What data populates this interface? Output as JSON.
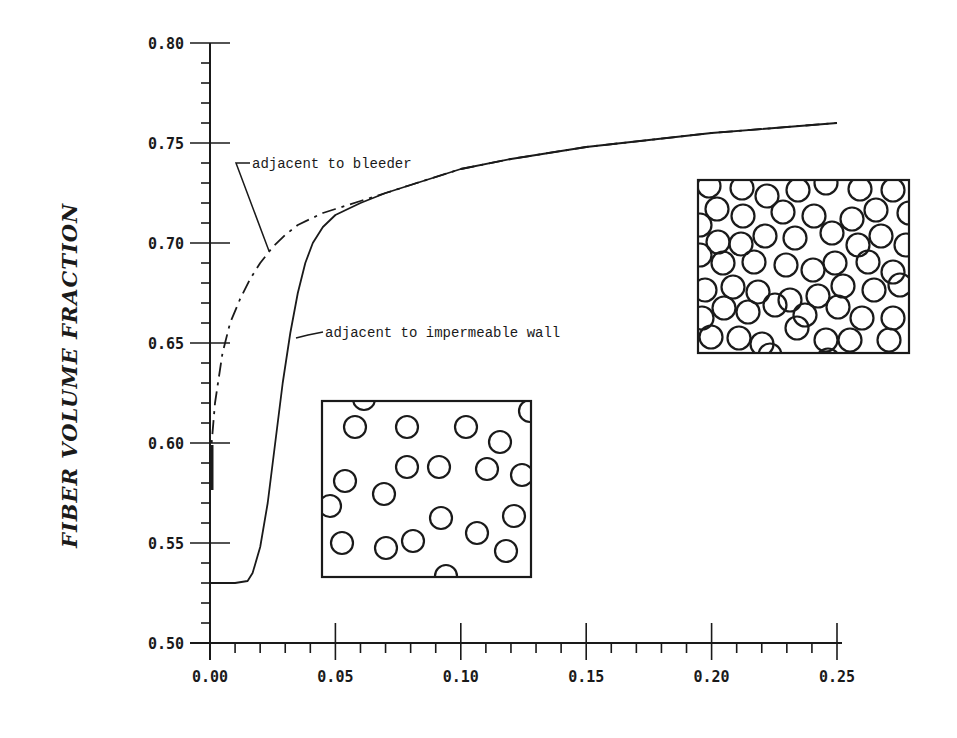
{
  "chart_data": {
    "type": "line",
    "title": "",
    "xlabel": "",
    "ylabel": "FIBER VOLUME FRACTION",
    "xlim": [
      0.0,
      0.25
    ],
    "ylim": [
      0.5,
      0.8
    ],
    "grid": false,
    "legend": "none (inline annotations)",
    "x_ticks": [
      "0.00",
      "0.05",
      "0.10",
      "0.15",
      "0.20",
      "0.25"
    ],
    "y_ticks": [
      "0.50",
      "0.55",
      "0.60",
      "0.65",
      "0.70",
      "0.75",
      "0.80"
    ],
    "series": [
      {
        "name": "adjacent to bleeder",
        "style": "dash-dot",
        "x": [
          0.0,
          0.002,
          0.005,
          0.008,
          0.012,
          0.016,
          0.02,
          0.025,
          0.03,
          0.035,
          0.04,
          0.045,
          0.05,
          0.055,
          0.06,
          0.07,
          0.08,
          0.1,
          0.12,
          0.15,
          0.2,
          0.25
        ],
        "y": [
          0.59,
          0.62,
          0.645,
          0.66,
          0.672,
          0.682,
          0.69,
          0.698,
          0.704,
          0.709,
          0.712,
          0.715,
          0.717,
          0.719,
          0.721,
          0.725,
          0.729,
          0.737,
          0.742,
          0.748,
          0.755,
          0.76
        ]
      },
      {
        "name": "adjacent to impermeable wall",
        "style": "solid",
        "x": [
          0.0,
          0.01,
          0.015,
          0.017,
          0.02,
          0.023,
          0.026,
          0.029,
          0.032,
          0.035,
          0.038,
          0.041,
          0.045,
          0.05,
          0.055,
          0.06,
          0.07,
          0.08,
          0.1,
          0.12,
          0.15,
          0.2,
          0.25
        ],
        "y": [
          0.53,
          0.53,
          0.531,
          0.535,
          0.548,
          0.57,
          0.6,
          0.63,
          0.655,
          0.675,
          0.69,
          0.7,
          0.708,
          0.714,
          0.717,
          0.72,
          0.725,
          0.729,
          0.737,
          0.742,
          0.748,
          0.755,
          0.76
        ]
      }
    ],
    "annotations": [
      {
        "text": "adjacent to bleeder",
        "points_to": "dash-dot curve near x=0.022, y=0.695"
      },
      {
        "text": "adjacent to impermeable wall",
        "points_to": "solid curve near x=0.032, y=0.657"
      }
    ],
    "insets": [
      {
        "name": "sparse-fiber-packing",
        "description": "loosely packed circular fibers",
        "position": "lower-middle"
      },
      {
        "name": "dense-fiber-packing",
        "description": "tightly packed circular fibers",
        "position": "upper-right"
      }
    ]
  },
  "labels": {
    "ylabel": "FIBER VOLUME FRACTION",
    "annot_bleeder": "adjacent to bleeder",
    "annot_wall": "adjacent to impermeable wall"
  }
}
